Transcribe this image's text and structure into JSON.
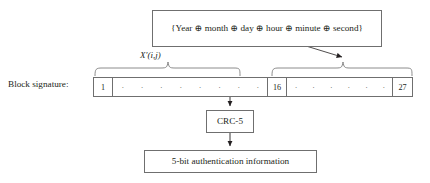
{
  "diagram": {
    "title_box": {
      "text": "{Year ⊕ month ⊕ day ⊕ hour ⊕ minute ⊕ second}"
    },
    "segment_label": "X′(i,j)",
    "signature_label": "Block signature:",
    "cells": {
      "first": "1",
      "middle": "16",
      "last": "27",
      "dot": "·",
      "left_dots": 8,
      "right_dots": 6
    },
    "crc_box": {
      "text": "CRC-5"
    },
    "output_box": {
      "text": "5-bit authentication information"
    },
    "colors": {
      "line": "#6f6f6f",
      "text": "#231f20",
      "background": "#ffffff"
    }
  }
}
